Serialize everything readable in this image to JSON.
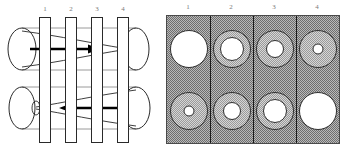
{
  "figure": {
    "panels": [
      {
        "id": "side-view",
        "name": "side-view-panel",
        "station_labels": [
          "1",
          "2",
          "3",
          "4"
        ],
        "tubes": [
          {
            "id": "upper-tube",
            "flow_label": "",
            "arrow_direction": "right",
            "profile": "converging-funnel",
            "note": "nozzle tapers from left opening to narrow throat at right"
          },
          {
            "id": "lower-tube",
            "flow_direction": "left",
            "arrow_direction": "left",
            "profile": "diverging-funnel",
            "note": "nozzle tapers from right opening to narrow throat at left"
          }
        ]
      },
      {
        "id": "cross-sections",
        "name": "cross-section-panel",
        "station_labels": [
          "1",
          "2",
          "3",
          "4"
        ],
        "rows": [
          {
            "id": "upper-row",
            "cells": [
              {
                "station": "1",
                "outer_radius_pct": 100,
                "core_radius_pct": 100
              },
              {
                "station": "2",
                "outer_radius_pct": 100,
                "core_radius_pct": 64
              },
              {
                "station": "3",
                "outer_radius_pct": 100,
                "core_radius_pct": 48
              },
              {
                "station": "4",
                "outer_radius_pct": 100,
                "core_radius_pct": 28
              }
            ]
          },
          {
            "id": "lower-row",
            "cells": [
              {
                "station": "1",
                "outer_radius_pct": 100,
                "core_radius_pct": 28
              },
              {
                "station": "2",
                "outer_radius_pct": 100,
                "core_radius_pct": 48
              },
              {
                "station": "3",
                "outer_radius_pct": 100,
                "core_radius_pct": 64
              },
              {
                "station": "4",
                "outer_radius_pct": 100,
                "core_radius_pct": 100
              }
            ]
          }
        ]
      }
    ],
    "colors": {
      "outline": "#2a2a2a",
      "hatch_dark": "#6e6e6e",
      "hatch_light": "#9a9a9a",
      "background": "#ffffff",
      "label": "#7a7a7a"
    }
  }
}
